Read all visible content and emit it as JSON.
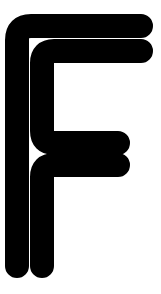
{
  "image": {
    "kind": "letterform-glyph",
    "character": "F",
    "description": "Stylized letter F drawn as a single continuous thick stroke with fully rounded end caps, tracing the outline of an F",
    "width": 161,
    "height": 294
  },
  "colors": {
    "background": "#ffffff",
    "stroke": "#000000"
  },
  "geometry": {
    "stroke_width": 24,
    "line_cap": "round",
    "line_join": "round",
    "corner_radius": 14,
    "path": "M 17 266 L 17 40 Q 17 26 31 26 L 141 26 M 141 51 L 54 51 Q 42 51 42 63 L 42 131 Q 42 143 54 143 L 118 143 M 118 165 L 54 165 Q 42 165 42 177 L 42 266",
    "segments": [
      {
        "name": "left-stem-outer",
        "from": [
          17,
          266
        ],
        "to": [
          17,
          40
        ]
      },
      {
        "name": "top-bar-upper",
        "from": [
          31,
          26
        ],
        "to": [
          141,
          26
        ]
      },
      {
        "name": "top-bar-lower",
        "from": [
          141,
          51
        ],
        "to": [
          54,
          51
        ]
      },
      {
        "name": "inner-stem-upper",
        "from": [
          42,
          63
        ],
        "to": [
          42,
          131
        ]
      },
      {
        "name": "middle-arm-upper",
        "from": [
          54,
          143
        ],
        "to": [
          118,
          143
        ]
      },
      {
        "name": "middle-arm-lower",
        "from": [
          118,
          165
        ],
        "to": [
          54,
          165
        ]
      },
      {
        "name": "inner-stem-lower",
        "from": [
          42,
          177
        ],
        "to": [
          42,
          266
        ]
      }
    ],
    "endpoints": [
      {
        "name": "bottom-left-cap",
        "at": [
          17,
          266
        ]
      },
      {
        "name": "bottom-inner-cap",
        "at": [
          42,
          266
        ]
      }
    ]
  },
  "labels": {
    "title": "F",
    "alt": "Letter F"
  }
}
